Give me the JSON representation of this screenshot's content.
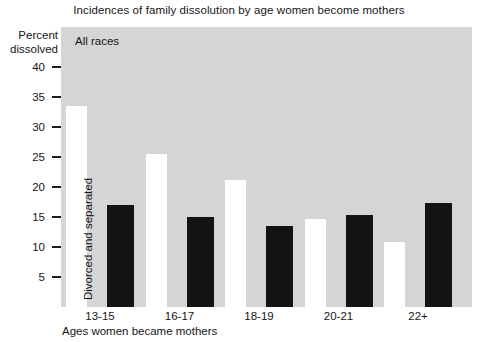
{
  "chart_data": {
    "type": "bar",
    "title": "Incidences of family dissolution by age women become mothers",
    "xlabel": "Ages women became mothers",
    "ylabel_line1": "Percent",
    "ylabel_line2": "dissolved",
    "group_note": "All races",
    "bar_annotation": "Divorced and separated",
    "categories": [
      "13-15",
      "16-17",
      "18-19",
      "20-21",
      "22+"
    ],
    "series": [
      {
        "name": "Divorced and separated",
        "color": "#ffffff",
        "values": [
          33.5,
          25.5,
          21.2,
          14.7,
          10.8
        ]
      },
      {
        "name": "Second measure",
        "color": "#131313",
        "values": [
          17.0,
          15.0,
          13.5,
          15.3,
          17.3
        ]
      }
    ],
    "yticks": [
      40,
      35,
      30,
      25,
      20,
      15,
      10,
      5
    ],
    "ytick_labels": [
      "40",
      "35",
      "30",
      "25",
      "20",
      "15",
      "10",
      "5"
    ],
    "ylim": [
      0,
      46.7
    ],
    "grid": false,
    "legend": "none",
    "plot_background": "#d5d5d5"
  }
}
